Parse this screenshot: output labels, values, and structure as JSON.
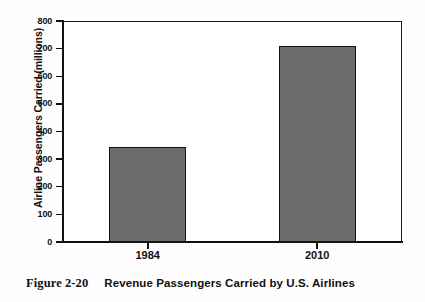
{
  "figure": {
    "caption_label": "Figure 2-20",
    "caption_title": "Revenue Passengers Carried by U.S. Airlines"
  },
  "chart_data": {
    "type": "bar",
    "title": "Revenue Passengers Carried by U.S. Airlines",
    "categories": [
      "1984",
      "2010"
    ],
    "values": [
      345,
      710
    ],
    "series": [
      {
        "name": "Airline Passengers Carried",
        "values": [
          345,
          710
        ]
      }
    ],
    "xlabel": "",
    "ylabel": "Airline Passengers Carried (millions)",
    "ylim": [
      0,
      800
    ],
    "ytick_step": 100,
    "yticks": [
      "800",
      "700",
      "600",
      "500",
      "400",
      "300",
      "200",
      "100",
      "0"
    ],
    "grid": false,
    "legend": false,
    "bar_color": "#6b6b6b",
    "bar_edge_color": "#141414",
    "axis_color": "#111111",
    "background_color": "#ffffff"
  }
}
